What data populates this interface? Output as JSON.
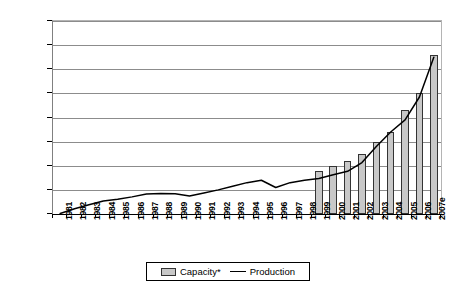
{
  "chart_data": {
    "type": "bar",
    "title": "",
    "xlabel": "",
    "ylabel": "Billions of gallons per year",
    "ylim": [
      0.0,
      8.0
    ],
    "ytick_labels": [
      "0.0",
      "1.0",
      "2.0",
      "3.0",
      "4.0",
      "5.0",
      "6.0",
      "7.0",
      "8.0"
    ],
    "ytick_values": [
      0.0,
      1.0,
      2.0,
      3.0,
      4.0,
      5.0,
      6.0,
      7.0,
      8.0
    ],
    "grid": true,
    "legend_position": "bottom-center",
    "categories": [
      "1981",
      "1982",
      "1983",
      "1984",
      "1985",
      "1986",
      "1987",
      "1988",
      "1989",
      "1990",
      "1991",
      "1992",
      "1993",
      "1994",
      "1995",
      "1996",
      "1997",
      "1998",
      "1999",
      "2000",
      "2001",
      "2002",
      "2003",
      "2004",
      "2005",
      "2006",
      "2007e"
    ],
    "series": [
      {
        "name": "Capacity*",
        "type": "bar",
        "color": "#c8c8c8",
        "edge_color": "#333333",
        "values": [
          null,
          null,
          null,
          null,
          null,
          null,
          null,
          null,
          null,
          null,
          null,
          null,
          null,
          null,
          null,
          null,
          null,
          null,
          1.8,
          2.0,
          2.2,
          2.5,
          3.0,
          3.4,
          4.3,
          5.0,
          6.6
        ]
      },
      {
        "name": "Production",
        "type": "line",
        "color": "#000000",
        "values": [
          0.02,
          0.22,
          0.38,
          0.54,
          0.61,
          0.71,
          0.83,
          0.85,
          0.84,
          0.75,
          0.87,
          1.0,
          1.15,
          1.3,
          1.4,
          1.1,
          1.3,
          1.4,
          1.47,
          1.63,
          1.77,
          2.13,
          2.8,
          3.4,
          3.9,
          4.85,
          6.5
        ]
      }
    ]
  },
  "legend": {
    "entries": [
      {
        "label": "Capacity*",
        "marker": "bar-swatch"
      },
      {
        "label": "Production",
        "marker": "line-swatch"
      }
    ]
  }
}
